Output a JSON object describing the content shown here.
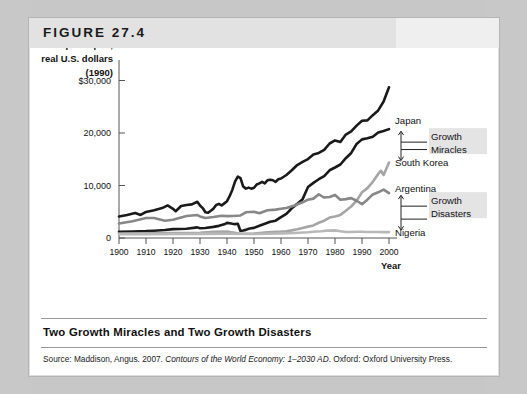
{
  "figure": {
    "number_label": "FIGURE 27.4",
    "caption": "Two Growth Miracles and Two Growth Disasters",
    "source_prefix": "Source:",
    "source_author": " Maddison, Angus. 2007. ",
    "source_title": "Contours of the World Economy: 1–2030 AD",
    "source_publisher": ". Oxford: Oxford University Press."
  },
  "chart_data": {
    "type": "line",
    "title": "Two Growth Miracles and Two Growth Disasters",
    "xlabel": "Year",
    "ylabel": "GDP per capita, real U.S. dollars (1990)",
    "ylabel_lines": [
      "GDP per capita,",
      "real U.S. dollars",
      "(1990)"
    ],
    "xlim": [
      1900,
      2000
    ],
    "ylim": [
      0,
      32000
    ],
    "grid": false,
    "legend": "inline-right-labels",
    "ytick_labels": [
      "$30,000",
      "20,000",
      "10,000",
      "0"
    ],
    "ytick_values": [
      30000,
      20000,
      10000,
      0
    ],
    "xtick_labels": [
      "1900",
      "1910",
      "1920",
      "1930",
      "1940",
      "1950",
      "1960",
      "1970",
      "1980",
      "1990",
      "2000"
    ],
    "xtick_values": [
      1900,
      1910,
      1920,
      1930,
      1940,
      1950,
      1960,
      1970,
      1980,
      1990,
      2000
    ],
    "annotations": [
      {
        "text": "Growth Miracles",
        "lines": [
          "Growth",
          "Miracles"
        ],
        "brackets": [
          "Japan",
          "South Korea"
        ]
      },
      {
        "text": "Growth Disasters",
        "lines": [
          "Growth",
          "Disasters"
        ],
        "brackets": [
          "Argentina",
          "Nigeria"
        ]
      }
    ],
    "series": [
      {
        "name": "United States",
        "label": "United States",
        "color": "#1a1a1a",
        "width": 2.6,
        "x": [
          1900,
          1903,
          1906,
          1908,
          1910,
          1913,
          1916,
          1918,
          1920,
          1921,
          1923,
          1925,
          1927,
          1929,
          1930,
          1931,
          1932,
          1933,
          1934,
          1935,
          1936,
          1937,
          1938,
          1939,
          1940,
          1941,
          1942,
          1943,
          1944,
          1945,
          1946,
          1947,
          1948,
          1949,
          1950,
          1951,
          1952,
          1953,
          1954,
          1955,
          1956,
          1957,
          1958,
          1959,
          1960,
          1962,
          1964,
          1966,
          1968,
          1970,
          1972,
          1974,
          1976,
          1978,
          1980,
          1982,
          1984,
          1986,
          1988,
          1990,
          1992,
          1994,
          1996,
          1998,
          2000
        ],
        "values": [
          4091,
          4400,
          4750,
          4400,
          4964,
          5301,
          5700,
          6200,
          5552,
          5100,
          6100,
          6300,
          6400,
          6899,
          6200,
          5700,
          4900,
          4800,
          5200,
          5600,
          6300,
          6500,
          6200,
          6600,
          7010,
          8000,
          9200,
          10800,
          11700,
          11400,
          9800,
          9400,
          9600,
          9400,
          9561,
          10200,
          10400,
          10700,
          10400,
          11000,
          11100,
          11000,
          10700,
          11200,
          11328,
          12000,
          12900,
          13900,
          14500,
          15030,
          15900,
          16200,
          16800,
          18000,
          18577,
          18300,
          19700,
          20300,
          21400,
          22330,
          22400,
          23400,
          24300,
          26000,
          28702
        ]
      },
      {
        "name": "Japan",
        "label": "Japan",
        "color": "#1a1a1a",
        "width": 2.6,
        "x": [
          1900,
          1905,
          1910,
          1913,
          1917,
          1920,
          1925,
          1929,
          1930,
          1932,
          1935,
          1937,
          1939,
          1940,
          1941,
          1942,
          1943,
          1944,
          1945,
          1946,
          1947,
          1948,
          1949,
          1950,
          1952,
          1954,
          1956,
          1958,
          1960,
          1962,
          1964,
          1966,
          1968,
          1970,
          1972,
          1974,
          1976,
          1978,
          1980,
          1982,
          1984,
          1986,
          1988,
          1990,
          1992,
          1994,
          1996,
          1998,
          2000
        ],
        "values": [
          1180,
          1230,
          1304,
          1387,
          1520,
          1696,
          1754,
          2026,
          1850,
          1900,
          2120,
          2315,
          2600,
          2874,
          2800,
          2700,
          2650,
          2700,
          1346,
          1440,
          1550,
          1750,
          1850,
          1921,
          2336,
          2700,
          3100,
          3300,
          3986,
          4600,
          5668,
          6500,
          7400,
          9714,
          10500,
          11200,
          11800,
          12900,
          13428,
          14000,
          15200,
          16200,
          17900,
          18789,
          19000,
          19300,
          20100,
          20400,
          20738
        ]
      },
      {
        "name": "South Korea",
        "label": "South Korea",
        "color": "#a6a6a6",
        "width": 2.6,
        "x": [
          1900,
          1910,
          1920,
          1930,
          1935,
          1940,
          1945,
          1950,
          1953,
          1955,
          1958,
          1960,
          1962,
          1964,
          1966,
          1968,
          1970,
          1972,
          1974,
          1976,
          1978,
          1980,
          1982,
          1984,
          1986,
          1988,
          1990,
          1992,
          1994,
          1996,
          1997,
          1998,
          1999,
          2000
        ],
        "values": [
          850,
          880,
          960,
          1000,
          1200,
          1250,
          800,
          854,
          1000,
          1100,
          1200,
          1226,
          1300,
          1450,
          1650,
          1900,
          2167,
          2400,
          2900,
          3300,
          3900,
          4114,
          4400,
          5200,
          6000,
          7100,
          8704,
          9500,
          10700,
          12200,
          12800,
          12000,
          13200,
          14375
        ]
      },
      {
        "name": "Argentina",
        "label": "Argentina",
        "color": "#878787",
        "width": 2.6,
        "x": [
          1900,
          1905,
          1910,
          1913,
          1917,
          1920,
          1925,
          1929,
          1930,
          1932,
          1935,
          1938,
          1940,
          1942,
          1945,
          1947,
          1950,
          1952,
          1955,
          1958,
          1960,
          1962,
          1965,
          1968,
          1970,
          1972,
          1974,
          1975,
          1976,
          1978,
          1980,
          1982,
          1984,
          1986,
          1988,
          1990,
          1992,
          1994,
          1996,
          1998,
          2000
        ],
        "values": [
          2756,
          3200,
          3822,
          3797,
          3300,
          3473,
          4200,
          4367,
          4100,
          3800,
          4000,
          4250,
          4161,
          4200,
          4300,
          4900,
          4987,
          4700,
          5300,
          5400,
          5559,
          5700,
          6200,
          6800,
          7302,
          7500,
          8334,
          8000,
          7700,
          7800,
          8206,
          7300,
          7400,
          7600,
          7100,
          6436,
          7300,
          8300,
          8700,
          9219,
          8544
        ]
      },
      {
        "name": "Nigeria",
        "label": "Nigeria",
        "color": "#b8b8b8",
        "width": 2.6,
        "x": [
          1900,
          1910,
          1920,
          1930,
          1940,
          1950,
          1955,
          1960,
          1965,
          1970,
          1973,
          1975,
          1977,
          1980,
          1982,
          1984,
          1986,
          1988,
          1990,
          1992,
          1994,
          1996,
          1998,
          2000
        ],
        "values": [
          700,
          720,
          750,
          780,
          820,
          753,
          800,
          854,
          950,
          1100,
          1250,
          1300,
          1400,
          1450,
          1300,
          1150,
          1150,
          1200,
          1200,
          1150,
          1130,
          1150,
          1120,
          1120
        ]
      }
    ]
  }
}
